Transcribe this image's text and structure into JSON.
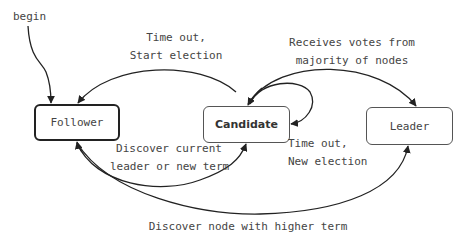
{
  "diagram": {
    "type": "state-machine",
    "nodes": {
      "follower": {
        "label": "Follower"
      },
      "candidate": {
        "label": "Candidate"
      },
      "leader": {
        "label": "Leader"
      }
    },
    "start_label": "begin",
    "edges": [
      {
        "from": "start",
        "to": "follower",
        "label": "begin"
      },
      {
        "from": "candidate",
        "to": "follower",
        "label_line1": "Time out,",
        "label_line2": "Start election"
      },
      {
        "from": "candidate",
        "to": "leader",
        "label_line1": "Receives votes from",
        "label_line2": "majority of nodes"
      },
      {
        "from": "candidate",
        "to": "candidate",
        "label_line1": "Time out,",
        "label_line2": "New election"
      },
      {
        "from": "follower",
        "to": "candidate",
        "label_line1": "Discover current",
        "label_line2": "leader or new term"
      },
      {
        "from": "follower",
        "to": "leader",
        "label": "Discover node with higher term"
      }
    ],
    "colors": {
      "stroke": "#222222",
      "node_border": "#555555",
      "text": "#444444",
      "background": "#ffffff"
    }
  }
}
